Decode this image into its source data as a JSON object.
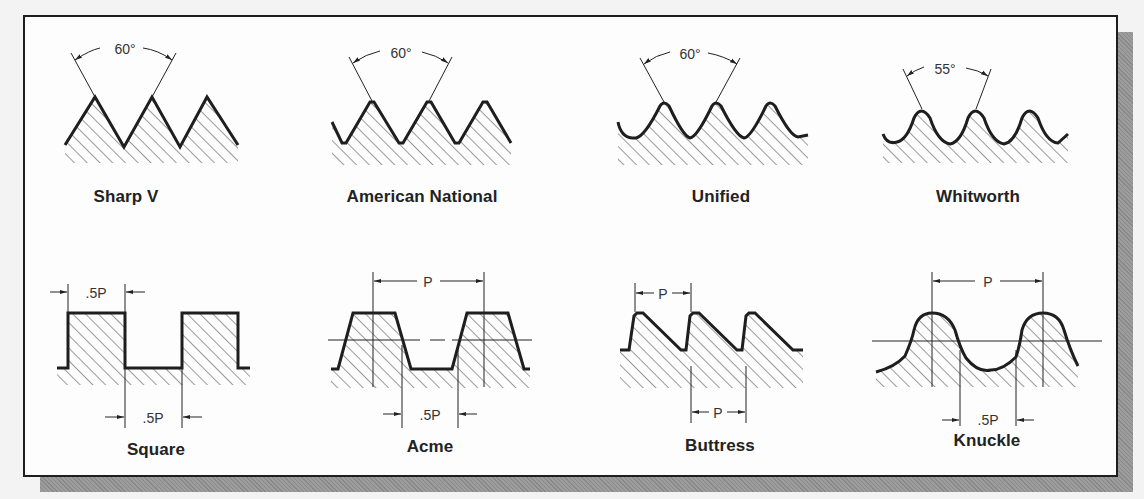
{
  "figure": {
    "top_row": [
      {
        "name": "Sharp V",
        "angle": "60°"
      },
      {
        "name": "American National",
        "angle": "60°"
      },
      {
        "name": "Unified",
        "angle": "60°"
      },
      {
        "name": "Whitworth",
        "angle": "55°"
      }
    ],
    "bottom_row": [
      {
        "name": "Square",
        "dim_top": ".5P",
        "dim_bottom": ".5P"
      },
      {
        "name": "Acme",
        "dim_top": "P",
        "dim_bottom": ".5P"
      },
      {
        "name": "Buttress",
        "dim_top": "P",
        "dim_bottom": "P"
      },
      {
        "name": "Knuckle",
        "dim_top": "P",
        "dim_bottom": ".5P"
      }
    ]
  },
  "colors": {
    "outline": "#1e1e1e",
    "hatch": "#3a3a3a",
    "background": "#fdfdfd",
    "shadow": "#8f8f8f"
  }
}
